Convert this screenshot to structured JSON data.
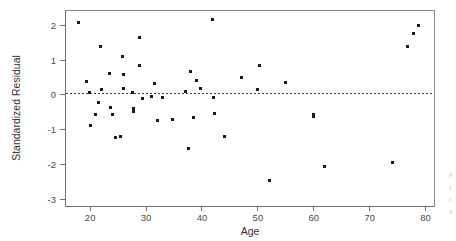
{
  "chart_data": {
    "type": "scatter",
    "title": "",
    "xlabel": "Age",
    "ylabel": "Standardized Residual",
    "xlim": [
      15.5,
      81.5
    ],
    "ylim": [
      -3.2,
      2.45
    ],
    "xticks": [
      20,
      30,
      40,
      50,
      60,
      70,
      80
    ],
    "xticklabels": [
      "20",
      "30",
      "40",
      "50",
      "60",
      "70",
      "80"
    ],
    "yticks": [
      2,
      1,
      0,
      -1,
      -2,
      -3
    ],
    "yticklabels": [
      "2",
      "1",
      "0",
      "-1",
      "-2",
      "-3"
    ],
    "grid": false,
    "legend": null,
    "reference_lines": [
      {
        "name": "zero-residual-line",
        "axis": "y",
        "value": 0.03,
        "style": "dashed"
      }
    ],
    "marker": {
      "shape": "square",
      "size": 3,
      "color": "#1a1a1a"
    },
    "series": [
      {
        "name": "Standardized residuals vs Age",
        "points": [
          {
            "x": 18.0,
            "y": 2.1
          },
          {
            "x": 19.3,
            "y": 0.38
          },
          {
            "x": 19.8,
            "y": 0.08
          },
          {
            "x": 20.0,
            "y": -0.87
          },
          {
            "x": 21.0,
            "y": -0.55
          },
          {
            "x": 21.5,
            "y": -0.23
          },
          {
            "x": 21.8,
            "y": 1.41
          },
          {
            "x": 22.0,
            "y": 0.16
          },
          {
            "x": 23.5,
            "y": 0.61
          },
          {
            "x": 23.7,
            "y": -0.36
          },
          {
            "x": 24.0,
            "y": -0.55
          },
          {
            "x": 24.6,
            "y": -1.23
          },
          {
            "x": 25.5,
            "y": -1.19
          },
          {
            "x": 25.8,
            "y": 1.12
          },
          {
            "x": 26.0,
            "y": 0.59
          },
          {
            "x": 26.0,
            "y": 0.2
          },
          {
            "x": 27.5,
            "y": 0.08
          },
          {
            "x": 27.8,
            "y": -0.38
          },
          {
            "x": 27.8,
            "y": -0.47
          },
          {
            "x": 28.8,
            "y": 1.65
          },
          {
            "x": 28.9,
            "y": 0.85
          },
          {
            "x": 29.3,
            "y": -0.1
          },
          {
            "x": 31.0,
            "y": -0.05
          },
          {
            "x": 31.5,
            "y": 0.34
          },
          {
            "x": 32.0,
            "y": -0.73
          },
          {
            "x": 33.0,
            "y": -0.08
          },
          {
            "x": 34.8,
            "y": -0.7
          },
          {
            "x": 37.0,
            "y": 0.11
          },
          {
            "x": 37.5,
            "y": -1.53
          },
          {
            "x": 38.0,
            "y": 0.68
          },
          {
            "x": 38.5,
            "y": -0.65
          },
          {
            "x": 39.0,
            "y": 0.41
          },
          {
            "x": 39.7,
            "y": 0.19
          },
          {
            "x": 41.9,
            "y": 2.17
          },
          {
            "x": 42.0,
            "y": -0.07
          },
          {
            "x": 42.2,
            "y": -0.52
          },
          {
            "x": 44.0,
            "y": -1.21
          },
          {
            "x": 47.0,
            "y": 0.51
          },
          {
            "x": 50.0,
            "y": 0.15
          },
          {
            "x": 50.3,
            "y": 0.86
          },
          {
            "x": 52.0,
            "y": -2.46
          },
          {
            "x": 55.0,
            "y": 0.35
          },
          {
            "x": 59.9,
            "y": -0.57
          },
          {
            "x": 60.0,
            "y": -0.62
          },
          {
            "x": 62.0,
            "y": -2.05
          },
          {
            "x": 74.0,
            "y": -1.94
          },
          {
            "x": 76.8,
            "y": 1.39
          },
          {
            "x": 77.8,
            "y": 1.78
          },
          {
            "x": 78.8,
            "y": 2.01
          }
        ]
      }
    ]
  },
  "axes": {
    "x_title": "Age",
    "y_title": "Standardized Residual"
  },
  "edge_artifact": {
    "name": "page-edge-text",
    "lines": [
      "F",
      "t",
      "r",
      "v"
    ]
  }
}
